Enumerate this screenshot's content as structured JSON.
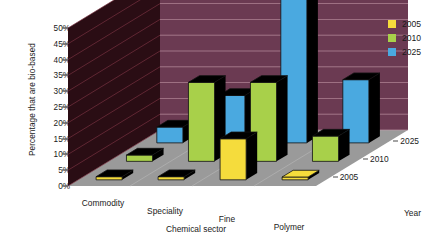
{
  "chart_data": {
    "type": "bar",
    "title": "",
    "subtitle": "",
    "categories": [
      "Commodity",
      "Speciality",
      "Fine",
      "Polymer"
    ],
    "series": [
      {
        "name": "2005",
        "color": "#f5dc3c",
        "values": [
          1,
          1,
          13,
          0
        ]
      },
      {
        "name": "2010",
        "color": "#a8d04a",
        "values": [
          2,
          25,
          25,
          8
        ]
      },
      {
        "name": "2025",
        "color": "#4aa9e0",
        "values": [
          5,
          15,
          50,
          20
        ]
      }
    ],
    "xlabel": "Chemical sector",
    "ylabel": "Percentage that are bio-based",
    "zlabel": "Year",
    "ylim": [
      0,
      50
    ],
    "yticks": [
      "0%",
      "5%",
      "10%",
      "15%",
      "20%",
      "25%",
      "30%",
      "35%",
      "40%",
      "45%",
      "50%"
    ],
    "ytick_values": [
      0,
      5,
      10,
      15,
      20,
      25,
      30,
      35,
      40,
      45,
      50
    ],
    "ztick_labels": [
      "2005",
      "2010",
      "2025"
    ],
    "grid": true,
    "legend_position": "right",
    "projection": "3d",
    "units": "percent"
  },
  "legend": {
    "items": [
      {
        "label": "2005",
        "color": "#f5dc3c"
      },
      {
        "label": "2010",
        "color": "#a8d04a"
      },
      {
        "label": "2025",
        "color": "#4aa9e0"
      }
    ]
  },
  "axes": {
    "y_title": "Percentage that are bio-based",
    "x_title": "Chemical sector",
    "z_title": "Year",
    "y_ticks": [
      "50%",
      "45%",
      "40%",
      "35%",
      "30%",
      "25%",
      "20%",
      "15%",
      "10%",
      "5%",
      "0%"
    ],
    "x_ticks": [
      "Commodity",
      "Speciality",
      "Fine",
      "Polymer"
    ],
    "z_ticks": [
      "2025",
      "2010",
      "2005"
    ]
  },
  "colors": {
    "back_wall": "#6b3a52",
    "side_wall": "#2a0d14",
    "floor": "#9a9a9a",
    "bar_side": "#000000",
    "series_2005": "#f5dc3c",
    "series_2010": "#a8d04a",
    "series_2025": "#4aa9e0"
  }
}
